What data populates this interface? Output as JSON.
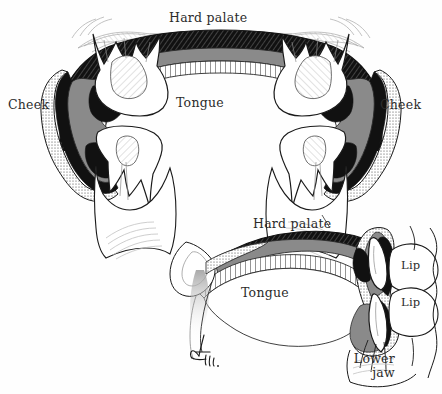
{
  "figure": {
    "background_color": "#fefefe",
    "ink_color": "#1a1a1a",
    "tissue_gray": "#8a8a8a",
    "bone_black": "#111111",
    "epithelium_white": "#ffffff",
    "label_color": "#2b2b2b",
    "width": 442,
    "height": 394
  },
  "coronal_section": {
    "name": "coronal-section",
    "labels": {
      "hard_palate": "Hard palate",
      "tongue": "Tongue",
      "cheek_left": "Cheek",
      "cheek_right": "Cheek"
    }
  },
  "sagittal_section": {
    "name": "sagittal-section",
    "labels": {
      "hard_palate": "Hard palate",
      "tongue": "Tongue",
      "lip_upper": "Lip",
      "lip_lower": "Lip",
      "lower_jaw_line1": "Lower",
      "lower_jaw_line2": "jaw"
    }
  },
  "signature": {
    "name": "artist-signature",
    "text": "Dohn."
  }
}
